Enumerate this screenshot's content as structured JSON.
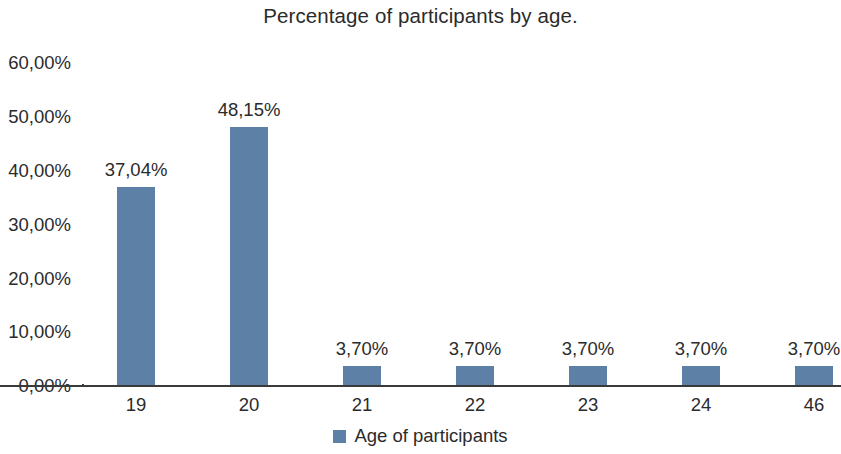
{
  "chart_data": {
    "type": "bar",
    "title": "Percentage of participants by age.",
    "xlabel": "",
    "ylabel": "",
    "categories": [
      "19",
      "20",
      "21",
      "22",
      "23",
      "24",
      "46"
    ],
    "values": [
      37.04,
      48.15,
      3.7,
      3.7,
      3.7,
      3.7,
      3.7
    ],
    "data_labels": [
      "37,04%",
      "48,15%",
      "3,70%",
      "3,70%",
      "3,70%",
      "3,70%",
      "3,70%"
    ],
    "ylim": [
      0,
      60
    ],
    "y_ticks": [
      0,
      10,
      20,
      30,
      40,
      50,
      60
    ],
    "y_tick_labels": [
      "0,00%",
      "10,00%",
      "20,00%",
      "30,00%",
      "40,00%",
      "50,00%",
      "60,00%"
    ],
    "grid": false,
    "legend": {
      "position": "bottom",
      "entries": [
        {
          "name": "Age of participants",
          "color": "#5d81a6"
        }
      ]
    },
    "series": [
      {
        "name": "Age of participants",
        "color": "#5d81a6",
        "values": [
          37.04,
          48.15,
          3.7,
          3.7,
          3.7,
          3.7,
          3.7
        ]
      }
    ],
    "colors": {
      "bar": "#5d81a6",
      "axis": "#3a3a3a",
      "text": "#2b2b2b",
      "background": "#ffffff"
    }
  }
}
